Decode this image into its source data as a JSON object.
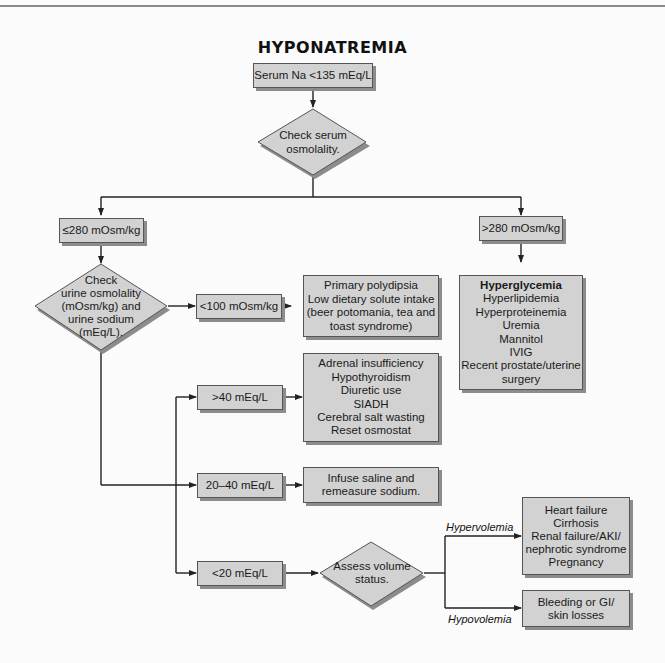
{
  "title": "HYPONATREMIA",
  "colors": {
    "box_fill": "#d2d2d2",
    "box_border": "#555555",
    "shadow": "#8c8c8c",
    "line": "#222222",
    "background": "#fbfbfb"
  },
  "nodes": {
    "start": {
      "label": "Serum Na <135 mEq/L"
    },
    "check_serum_osm": {
      "lines": [
        "Check serum",
        "osmolality."
      ]
    },
    "low_osm": {
      "label": "≤280 mOsm/kg"
    },
    "high_osm": {
      "label": ">280 mOsm/kg"
    },
    "high_osm_causes": {
      "lines": [
        "Hyperglycemia",
        "Hyperlipidemia",
        "Hyperproteinemia",
        "Uremia",
        "Mannitol",
        "IVIG",
        "Recent prostate/uterine",
        "surgery"
      ]
    },
    "check_urine": {
      "lines": [
        "Check",
        "urine osmolality",
        "(mOsm/kg) and",
        "urine sodium",
        "(mEq/L)."
      ]
    },
    "urine_osm_low": {
      "label": "<100 mOsm/kg"
    },
    "urine_osm_low_causes": {
      "lines": [
        "Primary polydipsia",
        "Low dietary solute intake",
        "(beer potomania, tea and",
        "toast syndrome)"
      ]
    },
    "urine_na_high": {
      "label": ">40 mEq/L"
    },
    "urine_na_high_causes": {
      "lines": [
        "Adrenal insufficiency",
        "Hypothyroidism",
        "Diuretic use",
        "SIADH",
        "Cerebral salt wasting",
        "Reset osmostat"
      ]
    },
    "urine_na_mid": {
      "label": "20–40 mEq/L"
    },
    "urine_na_mid_action": {
      "lines": [
        "Infuse saline and",
        "remeasure sodium."
      ]
    },
    "urine_na_low": {
      "label": "<20 mEq/L"
    },
    "assess_volume": {
      "lines": [
        "Assess volume",
        "status."
      ]
    },
    "hypervolemia_causes": {
      "lines": [
        "Heart failure",
        "Cirrhosis",
        "Renal failure/AKI/",
        "nephrotic syndrome",
        "Pregnancy"
      ]
    },
    "hypovolemia_causes": {
      "lines": [
        "Bleeding or GI/",
        "skin losses"
      ]
    }
  },
  "edge_labels": {
    "hypervolemia": "Hypervolemia",
    "hypovolemia": "Hypovolemia"
  }
}
